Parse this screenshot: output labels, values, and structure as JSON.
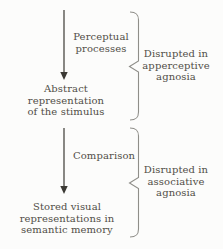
{
  "figure": {
    "stages": [
      {
        "id": "perceptual-processes",
        "type": "process",
        "label": "Perceptual\nprocesses"
      },
      {
        "id": "abstract-representation",
        "type": "state",
        "label": "Abstract\nrepresentation\nof the stimulus"
      },
      {
        "id": "comparison",
        "type": "process",
        "label": "Comparison"
      },
      {
        "id": "stored-representations",
        "type": "state",
        "label": "Stored visual\nrepresentations in\nsemantic memory"
      }
    ],
    "annotations": [
      {
        "id": "apperceptive-agnosia",
        "label": "Disrupted in\napperceptive\nagnosia"
      },
      {
        "id": "associative-agnosia",
        "label": "Disrupted in\nassociative\nagnosia"
      }
    ],
    "colors": {
      "text": "#514e47",
      "arrow": "#3b3934",
      "brace": "#8f8e89",
      "background": "#fcfcfb"
    }
  }
}
